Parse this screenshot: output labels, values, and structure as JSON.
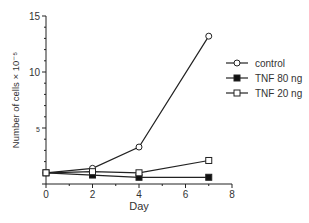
{
  "chart_data": {
    "type": "line",
    "title": "",
    "xlabel": "Day",
    "ylabel": "Number of cells × 10⁻⁵",
    "xlim": [
      0,
      8
    ],
    "ylim": [
      0,
      15
    ],
    "xticks": [
      "0",
      "2",
      "4",
      "6",
      "8"
    ],
    "yticks_labeled": [
      "5",
      "10",
      "15"
    ],
    "grid": false,
    "legend_position": "right",
    "series": [
      {
        "name": "control",
        "marker": "open-circle",
        "x": [
          0,
          2,
          4,
          7
        ],
        "y": [
          1.0,
          1.4,
          3.3,
          13.2
        ]
      },
      {
        "name": "TNF 80 ng",
        "marker": "filled-square",
        "x": [
          0,
          2,
          4,
          7
        ],
        "y": [
          1.0,
          0.8,
          0.6,
          0.6
        ]
      },
      {
        "name": "TNF 20 ng",
        "marker": "open-square",
        "x": [
          0,
          2,
          4,
          7
        ],
        "y": [
          1.0,
          1.1,
          1.0,
          2.1
        ]
      }
    ]
  },
  "labels": {
    "xlabel": "Day",
    "ylabel": "Number of cells × 10⁻⁵",
    "legend": [
      "control",
      "TNF 80 ng",
      "TNF 20 ng"
    ]
  }
}
